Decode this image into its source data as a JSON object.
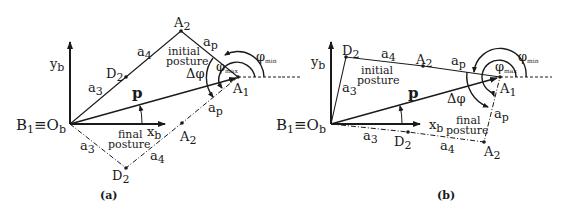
{
  "figure": {
    "panels": [
      {
        "id": "a",
        "caption": "(a)",
        "origin_label": "B",
        "origin_sub": "1",
        "origin_equiv": "≡O",
        "origin_equiv_sub": "b",
        "y_axis": "y",
        "y_axis_sub": "b",
        "x_axis": "x",
        "x_axis_sub": "b",
        "vector": "p",
        "a1": "A",
        "a1_sub": "1",
        "a2": "A",
        "a2_sub": "2",
        "d2": "D",
        "d2_sub": "2",
        "a3": "a",
        "a3_sub": "3",
        "a4": "a",
        "a4_sub": "4",
        "ap": "a",
        "ap_sub": "p",
        "phi_min": "φ",
        "phi_min_sub": "min",
        "phi_max": "φ",
        "phi_max_sub": "max",
        "delta_phi": "Δφ",
        "initial_1": "initial",
        "initial_2": "posture",
        "final_1": "final",
        "final_2": "posture"
      },
      {
        "id": "b",
        "caption": "(b)",
        "origin_label": "B",
        "origin_sub": "1",
        "origin_equiv": "≡O",
        "origin_equiv_sub": "b",
        "y_axis": "y",
        "y_axis_sub": "b",
        "x_axis": "x",
        "x_axis_sub": "b",
        "vector": "p",
        "a1": "A",
        "a1_sub": "1",
        "a2": "A",
        "a2_sub": "2",
        "d2": "D",
        "d2_sub": "2",
        "a3": "a",
        "a3_sub": "3",
        "a4": "a",
        "a4_sub": "4",
        "ap": "a",
        "ap_sub": "p",
        "phi_min": "φ",
        "phi_min_sub": "min",
        "phi_max": "φ",
        "phi_max_sub": "max",
        "delta_phi": "Δφ",
        "initial_1": "initial",
        "initial_2": "posture",
        "final_1": "final",
        "final_2": "posture"
      }
    ],
    "colors": {
      "ink": "#1a1a1a",
      "background": "#ffffff"
    }
  }
}
